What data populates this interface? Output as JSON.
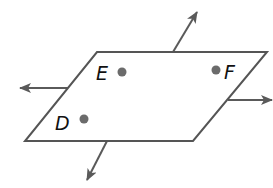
{
  "diagram": {
    "type": "plane-with-lines",
    "colors": {
      "outline": "#555555",
      "arrow": "#5a5a5a",
      "point": "#6b6b6b",
      "label": "#111111",
      "fill": "#ffffff"
    },
    "plane": {
      "vertices": [
        [
          97,
          52
        ],
        [
          267,
          52
        ],
        [
          193,
          141
        ],
        [
          25,
          141
        ]
      ]
    },
    "points": [
      {
        "label": "E",
        "x": 122,
        "y": 72
      },
      {
        "label": "F",
        "x": 216,
        "y": 70
      },
      {
        "label": "D",
        "x": 84,
        "y": 119
      }
    ],
    "lines": [
      {
        "name": "up",
        "from": [
          173,
          52
        ],
        "to": [
          197,
          12
        ]
      },
      {
        "name": "left",
        "from": [
          69,
          88
        ],
        "to": [
          20,
          88
        ]
      },
      {
        "name": "right",
        "from": [
          228,
          100
        ],
        "to": [
          272,
          100
        ]
      },
      {
        "name": "down",
        "from": [
          107,
          141
        ],
        "to": [
          87,
          180
        ]
      }
    ]
  }
}
